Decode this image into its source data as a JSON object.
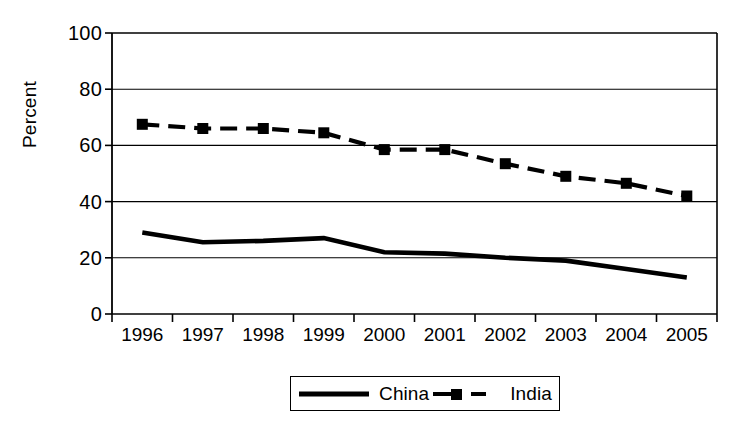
{
  "chart_data": {
    "type": "line",
    "title": "",
    "xlabel": "",
    "ylabel": "Percent",
    "categories": [
      "1996",
      "1997",
      "1998",
      "1999",
      "2000",
      "2001",
      "2002",
      "2003",
      "2004",
      "2005"
    ],
    "series": [
      {
        "name": "China",
        "style": "solid",
        "marker": "none",
        "color": "#000000",
        "values": [
          29,
          25.5,
          26,
          27,
          22,
          21.5,
          20,
          19,
          16,
          13
        ]
      },
      {
        "name": "India",
        "style": "dashed",
        "marker": "square",
        "color": "#000000",
        "values": [
          67.5,
          66,
          66,
          64.5,
          58.5,
          58.5,
          53.5,
          49,
          46.5,
          42
        ]
      }
    ],
    "ylim": [
      0,
      100
    ],
    "y_ticks": [
      "0",
      "20",
      "40",
      "60",
      "80",
      "100"
    ],
    "grid": "horizontal",
    "legend_position": "bottom"
  },
  "legend": {
    "items": [
      {
        "label": "China",
        "swatch": "solid-line-swatch"
      },
      {
        "label": "India",
        "swatch": "dashed-square-line-swatch"
      }
    ]
  }
}
